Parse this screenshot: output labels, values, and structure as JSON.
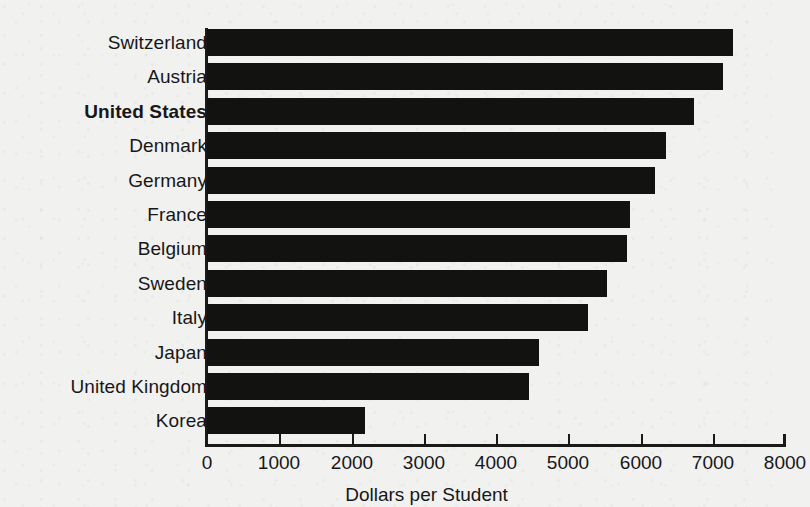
{
  "chart_data": {
    "type": "bar",
    "orientation": "horizontal",
    "title": "",
    "subtitle": "",
    "xlabel": "Dollars per Student",
    "ylabel": "",
    "xlim": [
      0,
      8000
    ],
    "xticks": [
      0,
      1000,
      2000,
      3000,
      4000,
      5000,
      6000,
      7000,
      8000
    ],
    "xtick_labels": [
      "0",
      "1000",
      "2000",
      "3000",
      "4000",
      "5000",
      "6000",
      "7000",
      "8000"
    ],
    "grid": false,
    "legend": null,
    "bar_color": "#121210",
    "background_color": "#f1f1ef",
    "highlight_category": "United States",
    "categories": [
      "Switzerland",
      "Austria",
      "United States",
      "Denmark",
      "Germany",
      "France",
      "Belgium",
      "Sweden",
      "Italy",
      "Japan",
      "United Kingdom",
      "Korea"
    ],
    "values": [
      7280,
      7140,
      6740,
      6350,
      6200,
      5850,
      5810,
      5530,
      5270,
      4600,
      4450,
      2190
    ],
    "bars": [
      {
        "label": "Switzerland",
        "value": 7280,
        "highlighted": false
      },
      {
        "label": "Austria",
        "value": 7140,
        "highlighted": false
      },
      {
        "label": "United States",
        "value": 6740,
        "highlighted": true
      },
      {
        "label": "Denmark",
        "value": 6350,
        "highlighted": false
      },
      {
        "label": "Germany",
        "value": 6200,
        "highlighted": false
      },
      {
        "label": "France",
        "value": 5850,
        "highlighted": false
      },
      {
        "label": "Belgium",
        "value": 5810,
        "highlighted": false
      },
      {
        "label": "Sweden",
        "value": 5530,
        "highlighted": false
      },
      {
        "label": "Italy",
        "value": 5270,
        "highlighted": false
      },
      {
        "label": "Japan",
        "value": 4600,
        "highlighted": false
      },
      {
        "label": "United Kingdom",
        "value": 4450,
        "highlighted": false
      },
      {
        "label": "Korea",
        "value": 2190,
        "highlighted": false
      }
    ]
  },
  "layout": {
    "plot_left": 167,
    "plot_top": 13,
    "plot_width": 578,
    "plot_height": 414,
    "band_height": 34.4,
    "bar_height": 27
  }
}
